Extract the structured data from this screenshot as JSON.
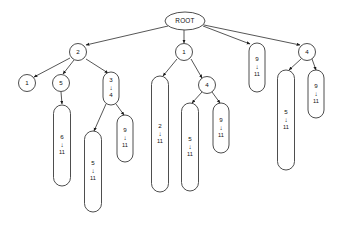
{
  "diagram": {
    "kind": "tree-diagram",
    "title_text": "ROOT",
    "arrow_glyph": "↓",
    "canvas": {
      "width": 344,
      "height": 226,
      "background": "#ffffff"
    },
    "colors": {
      "stroke": "#3a3a3a",
      "edge": "#2b2b2b",
      "text": "#111111",
      "fill": "#ffffff"
    },
    "nodes": [
      {
        "id": "root",
        "shape": "ellipse",
        "label": "ROOT",
        "lines": [
          "ROOT"
        ],
        "cx": 185,
        "cy": 21,
        "rx": 20,
        "ry": 9
      },
      {
        "id": "n2",
        "shape": "circle",
        "label": "2",
        "lines": [
          "2"
        ],
        "cx": 78,
        "cy": 52,
        "rx": 8.5,
        "ry": 8.5
      },
      {
        "id": "n1mid",
        "shape": "circle",
        "label": "1",
        "lines": [
          "1"
        ],
        "cx": 184,
        "cy": 52,
        "rx": 8.5,
        "ry": 8.5
      },
      {
        "id": "cap9_11_root",
        "shape": "capsule",
        "label": "9 ↓ 11",
        "lines": [
          "9",
          "↓",
          "11"
        ],
        "cx": 257,
        "cy": 67,
        "w": 16,
        "top": 43,
        "bottom": 92
      },
      {
        "id": "n4right",
        "shape": "circle",
        "label": "4",
        "lines": [
          "4"
        ],
        "cx": 307,
        "cy": 52,
        "rx": 8.5,
        "ry": 8.5
      },
      {
        "id": "n1leaf",
        "shape": "circle",
        "label": "1",
        "lines": [
          "1"
        ],
        "cx": 27,
        "cy": 83,
        "rx": 8.5,
        "ry": 8.5
      },
      {
        "id": "n5",
        "shape": "circle",
        "label": "5",
        "lines": [
          "5"
        ],
        "cx": 61,
        "cy": 83,
        "rx": 8.5,
        "ry": 8.5
      },
      {
        "id": "n3_4",
        "shape": "capsule",
        "label": "3 ↓ 4",
        "lines": [
          "3",
          "↓",
          "4"
        ],
        "cx": 111,
        "cy": 88,
        "w": 16,
        "top": 72,
        "bottom": 105
      },
      {
        "id": "cap6_11",
        "shape": "capsule",
        "label": "6 ↓ 11",
        "lines": [
          "6",
          "↓",
          "11"
        ],
        "cx": 62,
        "cy": 145,
        "w": 17,
        "top": 105,
        "bottom": 186
      },
      {
        "id": "cap5_11_left",
        "shape": "capsule",
        "label": "5 ↓ 11",
        "lines": [
          "5",
          "↓",
          "11"
        ],
        "cx": 93,
        "cy": 171,
        "w": 17,
        "top": 131,
        "bottom": 212
      },
      {
        "id": "cap9_11_left",
        "shape": "capsule",
        "label": "9 ↓ 11",
        "lines": [
          "9",
          "↓",
          "11"
        ],
        "cx": 125,
        "cy": 138,
        "w": 16,
        "top": 115,
        "bottom": 162
      },
      {
        "id": "cap2_11",
        "shape": "capsule",
        "label": "2 ↓ 11",
        "lines": [
          "2",
          "↓",
          "11"
        ],
        "cx": 160,
        "cy": 134,
        "w": 17,
        "top": 76,
        "bottom": 192
      },
      {
        "id": "n4mid",
        "shape": "circle",
        "label": "4",
        "lines": [
          "4"
        ],
        "cx": 207,
        "cy": 85,
        "rx": 8.5,
        "ry": 8.5
      },
      {
        "id": "cap5_11_mid",
        "shape": "capsule",
        "label": "5 ↓ 11",
        "lines": [
          "5",
          "↓",
          "11"
        ],
        "cx": 190,
        "cy": 147,
        "w": 17,
        "top": 103,
        "bottom": 191
      },
      {
        "id": "cap9_11_mid",
        "shape": "capsule",
        "label": "9 ↓ 11",
        "lines": [
          "9",
          "↓",
          "11"
        ],
        "cx": 221,
        "cy": 128,
        "w": 16,
        "top": 103,
        "bottom": 153
      },
      {
        "id": "cap5_11_right",
        "shape": "capsule",
        "label": "5 ↓ 11",
        "lines": [
          "5",
          "↓",
          "11"
        ],
        "cx": 286,
        "cy": 120,
        "w": 17,
        "top": 70,
        "bottom": 170
      },
      {
        "id": "cap9_11_right",
        "shape": "capsule",
        "label": "9 ↓ 11",
        "lines": [
          "9",
          "↓",
          "11"
        ],
        "cx": 316,
        "cy": 94,
        "w": 16,
        "top": 70,
        "bottom": 118
      }
    ],
    "edges": [
      {
        "from": "root",
        "to": "n2",
        "x1": 168,
        "y1": 26,
        "x2": 86,
        "y2": 45
      },
      {
        "from": "root",
        "to": "n1mid",
        "x1": 184,
        "y1": 30,
        "x2": 184,
        "y2": 43
      },
      {
        "from": "root",
        "to": "cap9_11_root",
        "x1": 203,
        "y1": 26,
        "x2": 250,
        "y2": 44
      },
      {
        "from": "root",
        "to": "n4right",
        "x1": 204,
        "y1": 25,
        "x2": 300,
        "y2": 45
      },
      {
        "from": "n2",
        "to": "n1leaf",
        "x1": 70,
        "y1": 58,
        "x2": 34,
        "y2": 77
      },
      {
        "from": "n2",
        "to": "n5",
        "x1": 74,
        "y1": 60,
        "x2": 63,
        "y2": 74
      },
      {
        "from": "n2",
        "to": "n3_4",
        "x1": 86,
        "y1": 59,
        "x2": 108,
        "y2": 73
      },
      {
        "from": "n5",
        "to": "cap6_11",
        "x1": 61,
        "y1": 92,
        "x2": 62,
        "y2": 104
      },
      {
        "from": "n3_4",
        "to": "cap5_11_left",
        "x1": 106,
        "y1": 104,
        "x2": 94,
        "y2": 131
      },
      {
        "from": "n3_4",
        "to": "cap9_11_left",
        "x1": 116,
        "y1": 104,
        "x2": 124,
        "y2": 115
      },
      {
        "from": "n1mid",
        "to": "cap2_11",
        "x1": 177,
        "y1": 59,
        "x2": 163,
        "y2": 76
      },
      {
        "from": "n1mid",
        "to": "n4mid",
        "x1": 191,
        "y1": 59,
        "x2": 202,
        "y2": 78
      },
      {
        "from": "n4mid",
        "to": "cap5_11_mid",
        "x1": 202,
        "y1": 92,
        "x2": 192,
        "y2": 103
      },
      {
        "from": "n4mid",
        "to": "cap9_11_mid",
        "x1": 212,
        "y1": 92,
        "x2": 220,
        "y2": 103
      },
      {
        "from": "n4right",
        "to": "cap5_11_right",
        "x1": 301,
        "y1": 59,
        "x2": 289,
        "y2": 70
      },
      {
        "from": "n4right",
        "to": "cap9_11_right",
        "x1": 312,
        "y1": 59,
        "x2": 316,
        "y2": 70
      }
    ]
  }
}
